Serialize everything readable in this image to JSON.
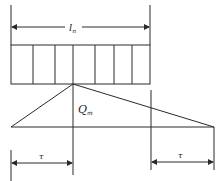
{
  "diagram": {
    "type": "load-distribution",
    "span_label": "l",
    "span_label_subscript": "n",
    "peak_label": "Q",
    "peak_label_subscript": "m",
    "left_interval_label": "τ",
    "right_interval_label": "τ",
    "cell_count": 7,
    "colors": {
      "line": "#2a2a2a",
      "background": "#ffffff"
    }
  }
}
